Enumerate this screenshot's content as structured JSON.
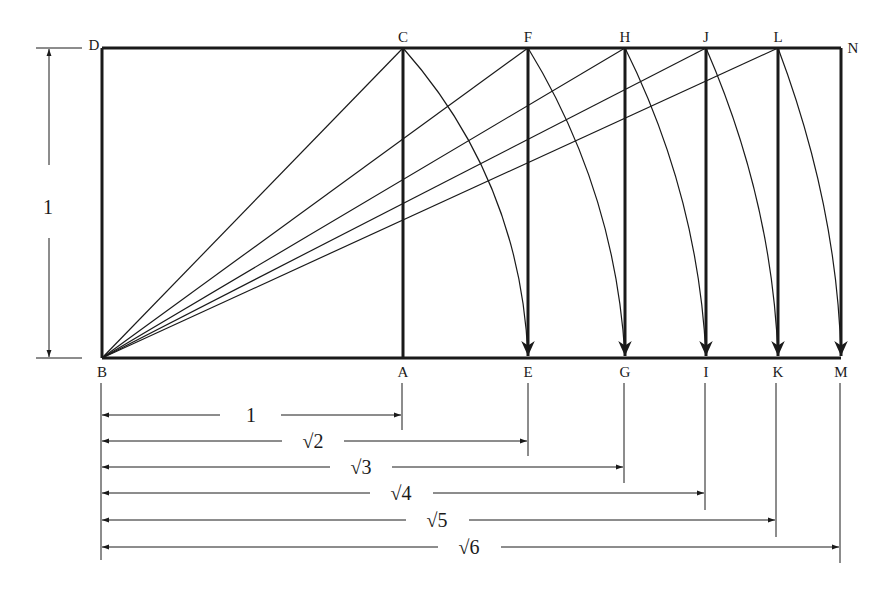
{
  "diagram": {
    "colors": {
      "stroke": "#1a1a1a",
      "background": "#ffffff"
    },
    "left_dimension": {
      "label": "1"
    },
    "top_points": [
      {
        "label": "D",
        "x": 102
      },
      {
        "label": "C",
        "x": 403
      },
      {
        "label": "F",
        "x": 528
      },
      {
        "label": "H",
        "x": 625
      },
      {
        "label": "J",
        "x": 706
      },
      {
        "label": "L",
        "x": 778
      },
      {
        "label": "N",
        "x": 841
      }
    ],
    "bottom_points": [
      {
        "label": "B",
        "x": 102
      },
      {
        "label": "A",
        "x": 403
      },
      {
        "label": "E",
        "x": 528
      },
      {
        "label": "G",
        "x": 625
      },
      {
        "label": "I",
        "x": 706
      },
      {
        "label": "K",
        "x": 778
      },
      {
        "label": "M",
        "x": 841
      }
    ],
    "dimensions": [
      {
        "label": "1",
        "to": "A"
      },
      {
        "label": "√2",
        "to": "E"
      },
      {
        "label": "√3",
        "to": "G"
      },
      {
        "label": "√4",
        "to": "I"
      },
      {
        "label": "√5",
        "to": "K"
      },
      {
        "label": "√6",
        "to": "M"
      }
    ]
  }
}
